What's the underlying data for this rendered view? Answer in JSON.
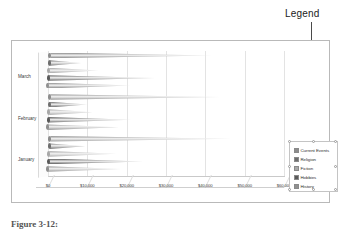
{
  "callout": {
    "label": "Legend"
  },
  "caption": {
    "text": "Figure 3-12:"
  },
  "legend": {
    "title": "Legend",
    "items": [
      {
        "label": "Current Events",
        "color": "#8c8c8c"
      },
      {
        "label": "Religion",
        "color": "#6e6e6e"
      },
      {
        "label": "Fiction",
        "color": "#a8a8a8"
      },
      {
        "label": "Hobbies",
        "color": "#5a5a5a"
      },
      {
        "label": "History",
        "color": "#909090"
      }
    ]
  },
  "chart_data": {
    "type": "bar",
    "title": "",
    "xlabel": "",
    "ylabel": "",
    "orientation": "horizontal",
    "style": "3d-cone",
    "grid": true,
    "legend_position": "right",
    "xlim": [
      0,
      60000
    ],
    "categories": [
      "January",
      "February",
      "March"
    ],
    "tick_labels": [
      "$0",
      "$10,000",
      "$20,000",
      "$30,000",
      "$40,000",
      "$50,000",
      "$60,000"
    ],
    "tick_values": [
      0,
      10000,
      20000,
      30000,
      40000,
      50000,
      60000
    ],
    "series": [
      {
        "name": "Current Events",
        "color": "#8c8c8c",
        "values": [
          46000,
          43000,
          41000
        ]
      },
      {
        "name": "Religion",
        "color": "#6e6e6e",
        "values": [
          9000,
          9500,
          8000
        ]
      },
      {
        "name": "Fiction",
        "color": "#a8a8a8",
        "values": [
          17000,
          11000,
          12500
        ]
      },
      {
        "name": "Hobbies",
        "color": "#5a5a5a",
        "values": [
          24000,
          21000,
          27000
        ]
      },
      {
        "name": "History",
        "color": "#909090",
        "values": [
          18500,
          18000,
          21000
        ]
      }
    ]
  }
}
